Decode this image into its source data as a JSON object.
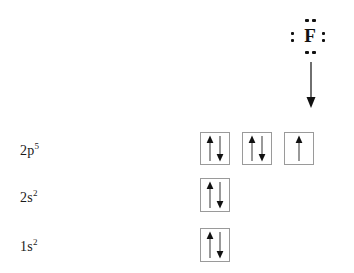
{
  "colors": {
    "background": "#ffffff",
    "ink": "#1a1a1a",
    "box_border": "#9a9a9a"
  },
  "lewis": {
    "element_symbol": "F",
    "dot_count": 8,
    "dot_pairs": [
      "top",
      "right",
      "bottom",
      "left"
    ]
  },
  "diagram": {
    "rows": [
      {
        "label_base": "2p",
        "label_sup": "5",
        "orbitals": [
          [
            "up",
            "down"
          ],
          [
            "up",
            "down"
          ],
          [
            "up"
          ]
        ]
      },
      {
        "label_base": "2s",
        "label_sup": "2",
        "orbitals": [
          [
            "up",
            "down"
          ]
        ]
      },
      {
        "label_base": "1s",
        "label_sup": "2",
        "orbitals": [
          [
            "up",
            "down"
          ]
        ]
      }
    ]
  }
}
